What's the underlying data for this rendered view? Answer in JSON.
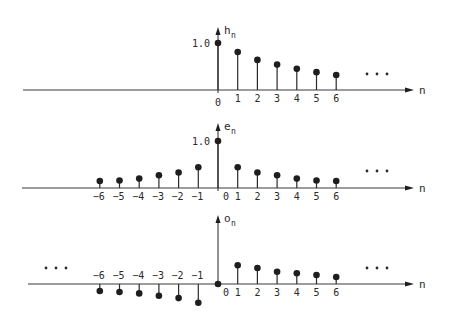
{
  "chart_data": [
    {
      "type": "stem",
      "name": "h_n",
      "ylabel": "h",
      "ylabel_sub": "n",
      "xlabel": "n",
      "ytick_label": "1.0",
      "x": [
        0,
        1,
        2,
        3,
        4,
        5,
        6
      ],
      "values": [
        1.0,
        0.81,
        0.64,
        0.54,
        0.45,
        0.38,
        0.32
      ],
      "tick_labels": [
        "0",
        "1",
        "2",
        "3",
        "4",
        "5",
        "6"
      ],
      "ellipsis_right": true,
      "ellipsis_left": false
    },
    {
      "type": "stem",
      "name": "e_n",
      "ylabel": "e",
      "ylabel_sub": "n",
      "xlabel": "n",
      "ytick_label": "1.0",
      "x": [
        -6,
        -5,
        -4,
        -3,
        -2,
        -1,
        0,
        1,
        2,
        3,
        4,
        5,
        6
      ],
      "values": [
        0.15,
        0.16,
        0.2,
        0.27,
        0.33,
        0.44,
        1.0,
        0.44,
        0.33,
        0.27,
        0.2,
        0.16,
        0.15
      ],
      "tick_labels": [
        "-6",
        "-5",
        "-4",
        "-3",
        "-2",
        "-1",
        "0",
        "1",
        "2",
        "3",
        "4",
        "5",
        "6"
      ],
      "ellipsis_right": true,
      "ellipsis_left": false
    },
    {
      "type": "stem",
      "name": "o_n",
      "ylabel": "o",
      "ylabel_sub": "n",
      "xlabel": "n",
      "ytick_label": "",
      "x": [
        -6,
        -5,
        -4,
        -3,
        -2,
        -1,
        0,
        1,
        2,
        3,
        4,
        5,
        6
      ],
      "values": [
        -0.15,
        -0.17,
        -0.2,
        -0.25,
        -0.3,
        -0.4,
        0.0,
        0.4,
        0.34,
        0.26,
        0.23,
        0.19,
        0.15
      ],
      "tick_labels": [
        "-6",
        "-5",
        "-4",
        "-3",
        "-2",
        "-1",
        "0",
        "1",
        "2",
        "3",
        "4",
        "5",
        "6"
      ],
      "ellipsis_right": true,
      "ellipsis_left": true
    }
  ],
  "layout": {
    "origin_x": 218,
    "unit_x": 19.7,
    "unit_y": 47,
    "axis_left": [
      23,
      22,
      28
    ],
    "axis_right": 414,
    "baselines": [
      90,
      188,
      284
    ],
    "axis_tops": [
      27,
      123,
      215
    ]
  }
}
